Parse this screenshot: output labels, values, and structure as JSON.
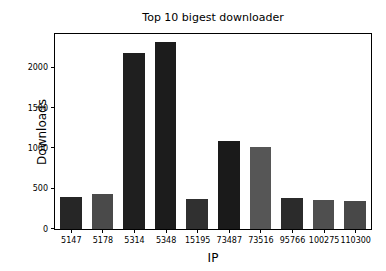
{
  "chart_data": {
    "type": "bar",
    "title": "Top 10 bigest downloader",
    "xlabel": "IP",
    "ylabel": "Downloads",
    "categories": [
      "5147",
      "5178",
      "5314",
      "5348",
      "15195",
      "73487",
      "73516",
      "95766",
      "100275",
      "110300"
    ],
    "values": [
      395,
      435,
      2180,
      2320,
      370,
      1090,
      1020,
      380,
      355,
      350
    ],
    "bar_colors": [
      "#262626",
      "#4a4a4a",
      "#1f1f1f",
      "#1c1c1c",
      "#303030",
      "#1a1a1a",
      "#565656",
      "#2b2b2b",
      "#4f4f4f",
      "#484848"
    ],
    "ylim": [
      0,
      2420
    ],
    "yticks": [
      0,
      500,
      1000,
      1500,
      2000
    ],
    "ytick_labels": [
      "0",
      "500",
      "1000",
      "1500",
      "2000"
    ],
    "grid": false,
    "legend": null,
    "series": [
      {
        "name": "Downloads",
        "values": [
          395,
          435,
          2180,
          2320,
          370,
          1090,
          1020,
          380,
          355,
          350
        ]
      }
    ]
  }
}
